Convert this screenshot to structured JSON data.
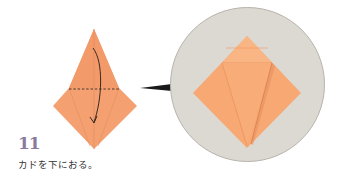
{
  "step": {
    "number": "11",
    "instruction": "カドを下におる。"
  },
  "colors": {
    "paper": "#f4a070",
    "paper_light": "#f8b88a",
    "step_number": "#8a7a9e",
    "circle_bg": "#dcd9d2",
    "pointer": "#1a1a1a"
  },
  "diagram": {
    "fold_line": "dashed-horizontal",
    "arrow": "curved-down"
  }
}
